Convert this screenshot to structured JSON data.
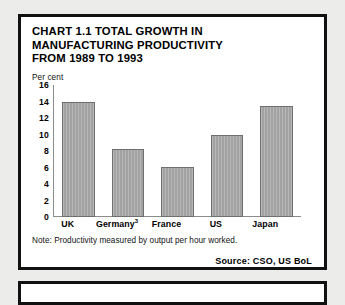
{
  "chart_data": {
    "type": "bar",
    "title": "CHART 1.1 TOTAL GROWTH IN MANUFACTURING PRODUCTIVITY FROM 1989 TO 1993",
    "title_lines": [
      "CHART 1.1 TOTAL GROWTH IN",
      "MANUFACTURING PRODUCTIVITY",
      "FROM 1989 TO 1993"
    ],
    "categories": [
      "UK",
      "Germany",
      "France",
      "US",
      "Japan"
    ],
    "category_labels": [
      "UK",
      "Germany³",
      "France",
      "US",
      "Japan"
    ],
    "values": [
      14.0,
      8.3,
      6.1,
      10.0,
      13.5
    ],
    "xlabel": "",
    "ylabel": "Per cent",
    "ylim": [
      0,
      16
    ],
    "yticks": [
      16,
      14,
      12,
      10,
      8,
      6,
      4,
      2,
      0
    ],
    "grid": false,
    "legend": null,
    "note": "Note: Productivity measured by output per hour worked.",
    "source": "Source: CSO, US BoL",
    "footnote_marker": "3",
    "bar_color": "#a9a9a9",
    "bar_border_color": "#6f6f6f",
    "axis_color": "#8c8c8c",
    "panel_border_color": "#111111",
    "page_background": "#ececeb"
  }
}
